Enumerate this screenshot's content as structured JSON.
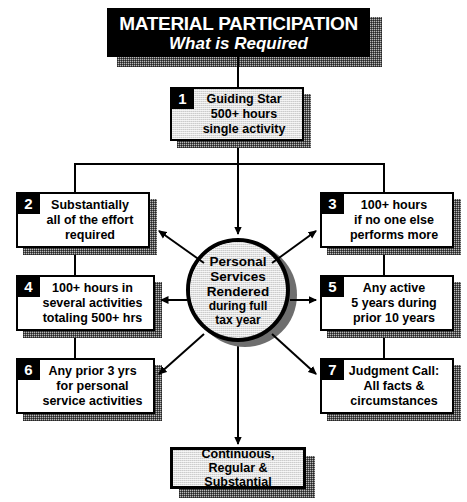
{
  "title": {
    "line1": "MATERIAL PARTICIPATION",
    "line2": "What is Required"
  },
  "colors": {
    "banner_bg": "#000000",
    "banner_text": "#ffffff",
    "box_border": "#000000",
    "box_fill": "#ffffff",
    "gray_fill": "#cccccc",
    "shadow": "#b9b9b9",
    "circle_shadow": "#6e6e6e",
    "line": "#000000"
  },
  "top_box": {
    "number": "1",
    "text": "Guiding Star\n500+ hours\nsingle activity"
  },
  "center": {
    "primary": "Personal\nServices\nRendered",
    "secondary": "during full\ntax year"
  },
  "bottom_box": {
    "text": "Continuous,\nRegular &\nSubstantial"
  },
  "boxes": [
    {
      "number": "2",
      "text": "Substantially\nall of the effort\nrequired",
      "side": "left"
    },
    {
      "number": "3",
      "text": "100+ hours\nif no one else\nperforms more",
      "side": "right"
    },
    {
      "number": "4",
      "text": "100+ hours in\nseveral activities\ntotaling 500+ hrs",
      "side": "left"
    },
    {
      "number": "5",
      "text": "Any active\n5 years during\nprior 10 years",
      "side": "right"
    },
    {
      "number": "6",
      "text": "Any prior 3 yrs\nfor personal\nservice activities",
      "side": "left"
    },
    {
      "number": "7",
      "text": "Judgment Call:\nAll facts &\ncircumstances",
      "side": "right"
    }
  ]
}
